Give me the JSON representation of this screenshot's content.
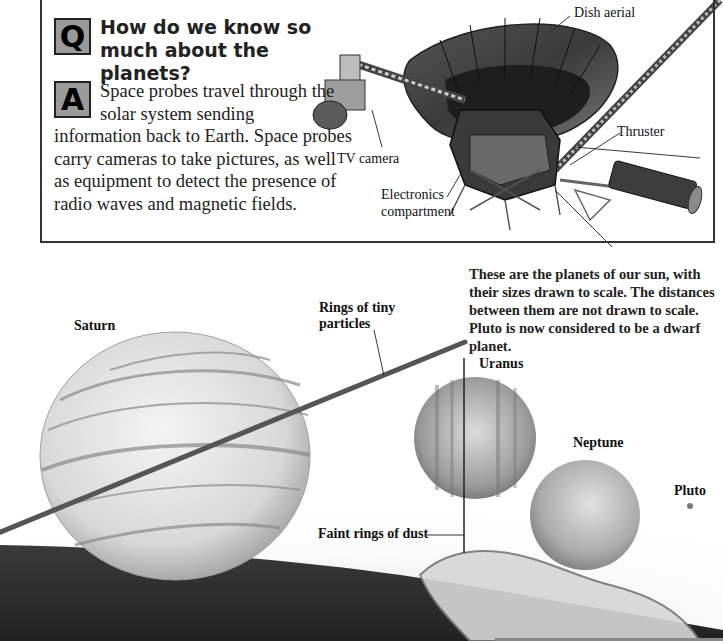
{
  "qa": {
    "question_badge": "Q",
    "question": "How do we know so much about the planets?",
    "answer_badge": "A",
    "answer_first": "Space probes travel through the solar system sending",
    "answer_rest": "information back to Earth. Space probes carry cameras to take pictures, as well as equipment to detect the presence of radio waves and magnetic fields."
  },
  "probe_labels": {
    "dish": "Dish aerial",
    "thruster": "Thruster",
    "camera": "TV camera",
    "electronics_1": "Electronics",
    "electronics_2": "compartment"
  },
  "caption": "These are the planets of our sun, with their sizes drawn to scale. The distances between them are not drawn to scale. Pluto is now considered to be a dwarf planet.",
  "planet_labels": {
    "saturn": "Saturn",
    "rings_1": "Rings of tiny",
    "rings_2": "particles",
    "uranus": "Uranus",
    "neptune": "Neptune",
    "pluto": "Pluto",
    "faint_rings": "Faint rings of dust"
  },
  "colors": {
    "badge_fill": "#9a9a9a",
    "ring": "#555555",
    "dark_surface": "#2a2a2a"
  }
}
